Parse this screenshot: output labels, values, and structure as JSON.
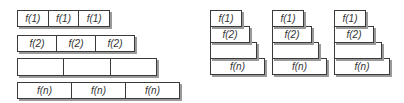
{
  "left_figure": {
    "rows": [
      {
        "cells": [
          "f(1)",
          "f(1)",
          "f(1)"
        ]
      },
      {
        "cells": [
          "f(2)",
          "f(2)",
          "f(2)"
        ]
      },
      {
        "cells": [
          "",
          "",
          ""
        ]
      },
      {
        "cells": [
          "f(n)",
          "f(n)",
          "f(n)"
        ]
      }
    ]
  },
  "right_figure": {
    "stacks": [
      {
        "levels": [
          "f(1)",
          "f(2)",
          "",
          "f(n)"
        ]
      },
      {
        "levels": [
          "f(1)",
          "f(2)",
          "",
          "f(n)"
        ]
      },
      {
        "levels": [
          "f(1)",
          "f(2)",
          "",
          "f(n)"
        ]
      }
    ]
  },
  "colors": {
    "border": "#3a3a3a",
    "shadow": "#9a9a9a",
    "text": "#333333"
  }
}
